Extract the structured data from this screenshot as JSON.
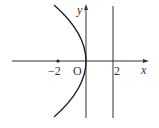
{
  "diagram": {
    "type": "parabola-graph",
    "equation_implied": "y^2 = -8x",
    "labels": {
      "y_axis": "y",
      "x_axis": "x",
      "origin": "O",
      "neg_two": "−2",
      "pos_two": "2"
    },
    "elements": [
      {
        "name": "x-axis",
        "kind": "arrow-line"
      },
      {
        "name": "y-axis",
        "kind": "arrow-line"
      },
      {
        "name": "parabola",
        "kind": "curve",
        "vertex": [
          0,
          0
        ],
        "opens": "left"
      },
      {
        "name": "directrix",
        "kind": "vertical-line",
        "x": 2
      },
      {
        "name": "focus-point",
        "kind": "dot",
        "x": -2,
        "y": 0
      }
    ],
    "colors": {
      "stroke": "#333333",
      "background": "#ffffff"
    }
  }
}
